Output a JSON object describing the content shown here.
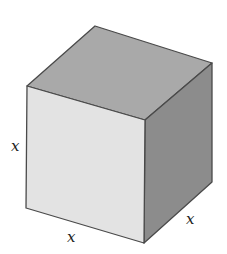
{
  "figure": {
    "shape": "cube",
    "colors": {
      "background": "#ffffff",
      "front_face": "#e3e3e3",
      "top_face": "#a9a9a9",
      "right_face": "#8c8c8c",
      "edge": "#4a4a4a",
      "label": "#222222"
    },
    "labels": {
      "left_edge": "x",
      "bottom_edge": "x",
      "depth_edge": "x"
    }
  }
}
